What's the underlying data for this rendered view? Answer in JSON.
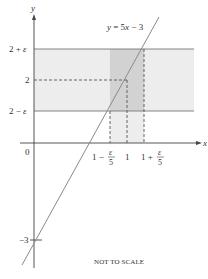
{
  "diagram": {
    "type": "function-graph",
    "equation_label": "y = 5x − 3",
    "note": "NOT TO SCALE",
    "axes": {
      "x_label": "x",
      "y_label": "y",
      "origin_label": "0"
    },
    "y_ticks": [
      {
        "label_main": "2 + ",
        "label_eps": "ε",
        "value": "2+eps"
      },
      {
        "label_main": "2",
        "value": "2"
      },
      {
        "label_main": "2 − ",
        "label_eps": "ε",
        "value": "2-eps"
      },
      {
        "label_main": "−3",
        "value": "-3"
      }
    ],
    "x_ticks": [
      {
        "prefix": "1 −",
        "num": "ε",
        "den": "5",
        "value": "1-eps/5"
      },
      {
        "prefix": "1",
        "value": "1"
      },
      {
        "prefix": "1 +",
        "num": "ε",
        "den": "5",
        "value": "1+eps/5"
      }
    ],
    "colors": {
      "axis": "#444444",
      "line": "#8a8a8a",
      "band_light": "#ececec",
      "band_dark": "#cfcfcf",
      "guide": "#666666"
    }
  }
}
